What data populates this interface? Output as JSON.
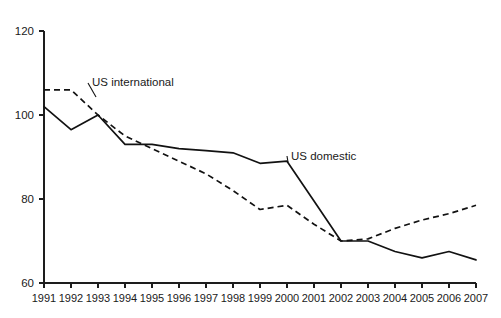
{
  "chart_data": {
    "type": "line",
    "title": "",
    "subtitle": "",
    "xlabel": "",
    "ylabel": "",
    "x": [
      1991,
      1992,
      1993,
      1994,
      1995,
      1996,
      1997,
      1998,
      1999,
      2000,
      2001,
      2002,
      2003,
      2004,
      2005,
      2006,
      2007
    ],
    "categories": [
      "1991",
      "1992",
      "1993",
      "1994",
      "1995",
      "1996",
      "1997",
      "1998",
      "1999",
      "2000",
      "2001",
      "2002",
      "2003",
      "2004",
      "2005",
      "2006",
      "2007"
    ],
    "series": [
      {
        "name": "US domestic",
        "style": "solid",
        "color": "#121212",
        "values": [
          102,
          96.5,
          100,
          93,
          93,
          92,
          91.5,
          91,
          88.5,
          89,
          79.5,
          70,
          70,
          67.5,
          66,
          67.5,
          65.5
        ]
      },
      {
        "name": "US international",
        "style": "dashed",
        "color": "#121212",
        "values": [
          106,
          106,
          100,
          95,
          92,
          89,
          86,
          82,
          77.5,
          78.5,
          74,
          70,
          70.5,
          73,
          75,
          76.5,
          78.5
        ]
      }
    ],
    "ylim": [
      60,
      120
    ],
    "xlim": [
      1991,
      2007
    ],
    "yticks": [
      60,
      80,
      100,
      120
    ],
    "ytick_labels": [
      "60",
      "80",
      "100",
      "120"
    ],
    "grid": false,
    "legend_position": "inline-annotations",
    "annotations": [
      {
        "text": "US international",
        "series": "US international",
        "x": 1993,
        "label_x": 92,
        "label_y": 86
      },
      {
        "text": "US domestic",
        "series": "US domestic",
        "x": 2000,
        "label_x": 291,
        "label_y": 160
      }
    ]
  }
}
